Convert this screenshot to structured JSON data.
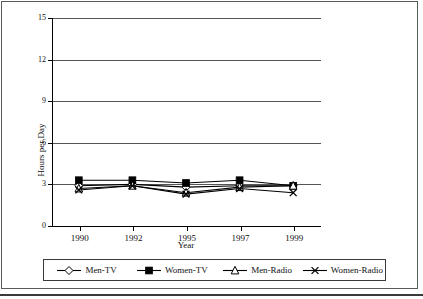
{
  "chart_data": {
    "type": "line",
    "title": "",
    "xlabel": "Year",
    "ylabel": "Hours per Day",
    "categories": [
      "1990",
      "1992",
      "1995",
      "1997",
      "1999"
    ],
    "x": [
      1990,
      1992,
      1995,
      1997,
      1999
    ],
    "ylim": [
      0,
      15
    ],
    "yticks": [
      0,
      3,
      6,
      9,
      12,
      15
    ],
    "grid": true,
    "legend_position": "bottom",
    "series": [
      {
        "name": "Men-TV",
        "marker": "open-diamond",
        "values": [
          2.9,
          3.0,
          2.8,
          2.9,
          2.9
        ]
      },
      {
        "name": "Women-TV",
        "marker": "filled-square",
        "values": [
          3.3,
          3.3,
          3.1,
          3.3,
          2.9
        ]
      },
      {
        "name": "Men-Radio",
        "marker": "open-triangle",
        "values": [
          2.7,
          2.9,
          2.4,
          2.8,
          2.9
        ]
      },
      {
        "name": "Women-Radio",
        "marker": "cross-x",
        "values": [
          2.6,
          2.9,
          2.3,
          2.7,
          2.4
        ]
      }
    ]
  },
  "axes": {
    "y_tick_labels": [
      "15",
      "12",
      "9",
      "6",
      "3",
      "0"
    ],
    "x_tick_labels": [
      "1990",
      "1992",
      "1995",
      "1997",
      "1999"
    ],
    "y_axis_title": "Hours per Day",
    "x_axis_title": "Year"
  },
  "legend": {
    "items": [
      {
        "label": "Men-TV",
        "marker": "open-diamond"
      },
      {
        "label": "Women-TV",
        "marker": "filled-square"
      },
      {
        "label": "Men-Radio",
        "marker": "open-triangle"
      },
      {
        "label": "Women-Radio",
        "marker": "cross-x"
      }
    ]
  },
  "colors": {
    "line": "#000000",
    "grid": "#555555",
    "frame": "#5a5a5a",
    "background": "#ffffff"
  }
}
